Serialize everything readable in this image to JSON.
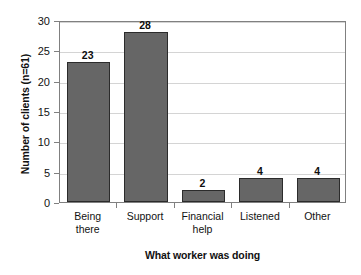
{
  "chart_data": {
    "type": "bar",
    "title": "",
    "subtitle": "",
    "categories": [
      "Being there",
      "Support",
      "Financial help",
      "Listened",
      "Other"
    ],
    "category_lines": [
      [
        "Being",
        "there"
      ],
      [
        "Support"
      ],
      [
        "Financial",
        "help"
      ],
      [
        "Listened"
      ],
      [
        "Other"
      ]
    ],
    "values": [
      23,
      28,
      2,
      4,
      4
    ],
    "data_labels": [
      "23",
      "28",
      "2",
      "4",
      "4"
    ],
    "xlabel": "What worker was doing",
    "ylabel": "Number of clients (n=61)",
    "ylim": [
      0,
      30
    ],
    "ytick_values": [
      0,
      5,
      10,
      15,
      20,
      25,
      30
    ],
    "ytick_labels": [
      "0",
      "5",
      "10",
      "15",
      "20",
      "25",
      "30"
    ],
    "grid": "horizontal",
    "legend": "none",
    "n": 61,
    "colors": {
      "bar_fill": "#666666",
      "bar_outline": "#2b2b2b",
      "gridline": "#d4d4d4",
      "axis": "#808080",
      "text": "#121212",
      "background": "#ffffff"
    }
  }
}
